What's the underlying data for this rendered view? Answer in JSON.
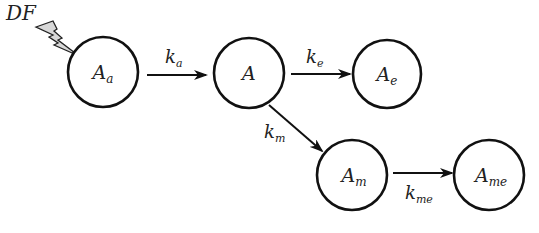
{
  "diagram": {
    "type": "compartment-flow",
    "source": {
      "label": "DF",
      "icon": "lightning-bolt-icon",
      "bolt_color": "#d8d8d8",
      "target": "Aa"
    },
    "nodes": [
      {
        "id": "Aa",
        "base": "A",
        "sub": "a",
        "cx": 103,
        "cy": 72,
        "r": 35
      },
      {
        "id": "A",
        "base": "A",
        "sub": "",
        "cx": 249,
        "cy": 73,
        "r": 35
      },
      {
        "id": "Ae",
        "base": "A",
        "sub": "e",
        "cx": 387,
        "cy": 74,
        "r": 34
      },
      {
        "id": "Am",
        "base": "A",
        "sub": "m",
        "cx": 352,
        "cy": 175,
        "r": 35
      },
      {
        "id": "Ame",
        "base": "A",
        "sub": "me",
        "cx": 489,
        "cy": 175,
        "r": 35
      }
    ],
    "edges": [
      {
        "from": "Aa",
        "to": "A",
        "base": "k",
        "sub": "a",
        "x1": 147,
        "y1": 75,
        "x2": 206,
        "y2": 75,
        "lx": 165,
        "ly": 63
      },
      {
        "from": "A",
        "to": "Ae",
        "base": "k",
        "sub": "e",
        "x1": 291,
        "y1": 74,
        "x2": 350,
        "y2": 74,
        "lx": 306,
        "ly": 63
      },
      {
        "from": "A",
        "to": "Am",
        "base": "k",
        "sub": "m",
        "x1": 269,
        "y1": 105,
        "x2": 322,
        "y2": 151,
        "lx": 264,
        "ly": 138
      },
      {
        "from": "Am",
        "to": "Ame",
        "base": "k",
        "sub": "me",
        "x1": 393,
        "y1": 173,
        "x2": 452,
        "y2": 173,
        "lx": 405,
        "ly": 199
      }
    ]
  }
}
